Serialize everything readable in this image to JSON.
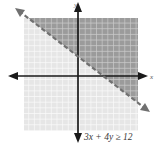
{
  "figure": {
    "background_color": "#ffffff"
  },
  "axes": {
    "x_axis_name": "x-axis",
    "y_axis_name": "y-axis",
    "axis_color": "#1a1a1a",
    "origin_x": 78,
    "origin_y": 76,
    "x_axis_label": "x",
    "y_axis_label": "y"
  },
  "grid": {
    "cell_size": 5.65,
    "left": 24,
    "top": 18,
    "right": 138,
    "bottom": 131,
    "unshaded_color": "#e9e9e9",
    "unshaded_line_color": "#fafafa",
    "shaded_color": "#9a9a9a",
    "shaded_line_color": "#c8c8c8"
  },
  "boundary_line": {
    "style": "dashed",
    "color": "#6e6e6e",
    "x1": 19,
    "y1": 11,
    "x2": 146,
    "y2": 109,
    "arrow_start": true,
    "arrow_end": true
  },
  "inequality": {
    "expression_lhs": "3x + 4y",
    "operator": "≥",
    "value": "12",
    "full_text": "3x + 4y ≥ 12",
    "label_color": "#3a3a3a"
  },
  "shading": {
    "region": "upper-right half-plane",
    "description": "Region where 3x + 4y is greater than or equal to 12"
  }
}
